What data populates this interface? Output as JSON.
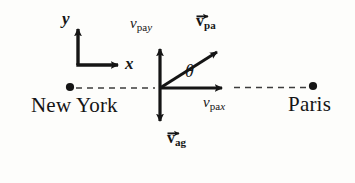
{
  "figure": {
    "type": "vector-diagram",
    "background_color": "#fdfdfb",
    "ink_color": "#151515"
  },
  "coordinate_axes": {
    "name": "coordinate-axes",
    "origin_px": [
      78,
      65
    ],
    "y_axis": {
      "label": "y",
      "tip_px": [
        78,
        25
      ],
      "direction": "up"
    },
    "x_axis": {
      "label": "x",
      "tip_px": [
        124,
        65
      ],
      "direction": "right"
    }
  },
  "route": {
    "name": "new-york-paris-route",
    "style": "dashed",
    "line_y_px": 88,
    "endpoints": [
      {
        "label": "New York",
        "dot_px": [
          70,
          87
        ],
        "side": "left"
      },
      {
        "label": "Paris",
        "dot_px": [
          313,
          86
        ],
        "side": "right"
      }
    ]
  },
  "vectors": {
    "origin_px": [
      160,
      88
    ],
    "items": [
      {
        "id": "v-pay",
        "symbol": "v",
        "subscript": "pay",
        "subscript_roman": "pa",
        "subscript_italic": "y",
        "bold": false,
        "has_overarrow": false,
        "direction": "up",
        "tip_px": [
          160,
          45
        ],
        "label_px": [
          130,
          18
        ],
        "description": "y-component of plane velocity relative to air"
      },
      {
        "id": "v-pax",
        "symbol": "v",
        "subscript": "pax",
        "subscript_roman": "pa",
        "subscript_italic": "x",
        "bold": false,
        "has_overarrow": false,
        "direction": "right",
        "tip_px": [
          228,
          88
        ],
        "label_px": [
          205,
          96
        ],
        "description": "x-component of plane velocity relative to air"
      },
      {
        "id": "v-pa",
        "symbol": "v",
        "subscript": "pa",
        "bold": true,
        "has_overarrow": true,
        "direction": "up-right",
        "tip_px": [
          223,
          47
        ],
        "label_px": [
          196,
          14
        ],
        "description": "velocity of plane relative to air"
      },
      {
        "id": "v-ag",
        "symbol": "v",
        "subscript": "ag",
        "bold": true,
        "has_overarrow": true,
        "direction": "down",
        "tip_px": [
          160,
          126
        ],
        "label_px": [
          168,
          132
        ],
        "description": "velocity of air relative to ground"
      }
    ]
  },
  "angle": {
    "name": "theta-angle",
    "label": "θ",
    "label_px": [
      188,
      66
    ],
    "between": [
      "v-pax",
      "v-pa"
    ],
    "vertex_px": [
      160,
      88
    ],
    "approx_degrees": 31
  }
}
